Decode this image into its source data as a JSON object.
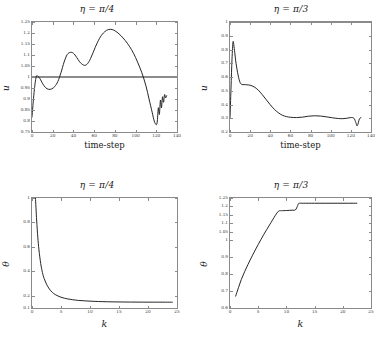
{
  "figure": {
    "panels": [
      {
        "id": "top-left",
        "title_symbol": "η",
        "title_eq": " = ",
        "title_value": "π/4",
        "xlabel": "time-step",
        "ylabel": "u"
      },
      {
        "id": "top-right",
        "title_symbol": "η",
        "title_eq": " = ",
        "title_value": "π/3",
        "xlabel": "time-step",
        "ylabel": "u"
      },
      {
        "id": "bottom-left",
        "title_symbol": "η",
        "title_eq": " = ",
        "title_value": "π/4",
        "xlabel": "k",
        "ylabel": "θ"
      },
      {
        "id": "bottom-right",
        "title_symbol": "η",
        "title_eq": " = ",
        "title_value": "π/3",
        "xlabel": "k",
        "ylabel": "θ"
      }
    ]
  },
  "chart_data": [
    {
      "type": "line",
      "id": "top-left",
      "title": "η = π/4",
      "xlabel": "time-step",
      "ylabel": "u",
      "xlim": [
        0,
        140
      ],
      "ylim": [
        0.75,
        1.25
      ],
      "xticks": [
        0,
        20,
        40,
        60,
        80,
        100,
        120,
        140
      ],
      "yticks": [
        0.75,
        0.8,
        0.85,
        0.9,
        0.95,
        1,
        1.05,
        1.1,
        1.15,
        1.2,
        1.25
      ],
      "grid": false,
      "legend": null,
      "series": [
        {
          "name": "u(t)",
          "color": "#1a1a1a",
          "x": [
            0,
            2,
            4,
            6,
            8,
            10,
            13,
            16,
            19,
            22,
            25,
            28,
            31,
            34,
            37,
            40,
            43,
            46,
            49,
            52,
            55,
            58,
            62,
            66,
            70,
            74,
            78,
            82,
            86,
            90,
            94,
            98,
            102,
            106,
            110,
            113,
            116,
            118,
            120,
            121,
            122,
            123,
            124,
            125,
            126,
            127,
            128,
            129,
            130
          ],
          "y": [
            0.818,
            0.93,
            1.0,
            1.002,
            0.99,
            0.972,
            0.952,
            0.944,
            0.946,
            0.957,
            0.98,
            1.02,
            1.068,
            1.102,
            1.112,
            1.108,
            1.09,
            1.069,
            1.056,
            1.054,
            1.07,
            1.1,
            1.145,
            1.182,
            1.205,
            1.216,
            1.215,
            1.204,
            1.187,
            1.166,
            1.14,
            1.108,
            1.067,
            1.02,
            0.96,
            0.9,
            0.84,
            0.8,
            0.783,
            0.8,
            0.86,
            0.83,
            0.895,
            0.86,
            0.91,
            0.885,
            0.92,
            0.905,
            0.915
          ]
        },
        {
          "name": "reference u = 1",
          "color": "#1a1a1a",
          "x": [
            0,
            140
          ],
          "y": [
            1.0,
            1.0
          ]
        }
      ]
    },
    {
      "type": "line",
      "id": "top-right",
      "title": "η = π/3",
      "xlabel": "time-step",
      "ylabel": "u",
      "xlim": [
        0,
        140
      ],
      "ylim": [
        0.2,
        1.0
      ],
      "xticks": [
        0,
        20,
        40,
        60,
        80,
        100,
        120,
        140
      ],
      "yticks": [
        0.2,
        0.3,
        0.4,
        0.5,
        0.6,
        0.7,
        0.8,
        0.9,
        1.0
      ],
      "grid": false,
      "legend": null,
      "series": [
        {
          "name": "reference u = 1",
          "color": "#1a1a1a",
          "x": [
            0,
            138
          ],
          "y": [
            1.0,
            1.0
          ]
        },
        {
          "name": "u(t)",
          "color": "#1a1a1a",
          "x": [
            0,
            1,
            2,
            3,
            4,
            5,
            6,
            8,
            10,
            12,
            14,
            17,
            20,
            24,
            28,
            32,
            36,
            40,
            44,
            48,
            52,
            56,
            60,
            66,
            72,
            78,
            84,
            90,
            96,
            102,
            108,
            112,
            116,
            120,
            123,
            125,
            126,
            127,
            128,
            129,
            130
          ],
          "y": [
            0.3,
            0.52,
            0.73,
            0.855,
            0.82,
            0.76,
            0.7,
            0.615,
            0.56,
            0.545,
            0.545,
            0.543,
            0.54,
            0.528,
            0.505,
            0.472,
            0.435,
            0.398,
            0.365,
            0.34,
            0.322,
            0.312,
            0.307,
            0.305,
            0.308,
            0.315,
            0.318,
            0.316,
            0.31,
            0.303,
            0.298,
            0.297,
            0.3,
            0.305,
            0.3,
            0.268,
            0.245,
            0.255,
            0.285,
            0.3,
            0.305
          ]
        }
      ]
    },
    {
      "type": "line",
      "id": "bottom-left",
      "title": "η = π/4",
      "xlabel": "k",
      "ylabel": "θ",
      "xlim": [
        0,
        25
      ],
      "ylim": [
        0.1,
        1.0
      ],
      "xticks": [
        0,
        5,
        10,
        15,
        20,
        25
      ],
      "yticks": [
        0.1,
        0.2,
        0.4,
        0.6,
        0.8,
        1.0
      ],
      "grid": false,
      "legend": null,
      "series": [
        {
          "name": "θ(k)",
          "color": "#1a1a1a",
          "x": [
            0.6,
            0.8,
            1.0,
            1.2,
            1.5,
            1.8,
            2.1,
            2.5,
            3.0,
            3.5,
            4.0,
            4.5,
            5.0,
            5.6,
            6.2,
            7.0,
            8.0,
            9.0,
            10.0,
            11.5,
            13.0,
            15.0,
            17.0,
            19.0,
            21.0,
            23.0,
            24.2
          ],
          "y": [
            1.0,
            0.82,
            0.68,
            0.575,
            0.465,
            0.39,
            0.34,
            0.295,
            0.255,
            0.228,
            0.21,
            0.198,
            0.188,
            0.18,
            0.174,
            0.168,
            0.162,
            0.159,
            0.156,
            0.153,
            0.151,
            0.1495,
            0.1485,
            0.148,
            0.1478,
            0.1476,
            0.1475
          ]
        }
      ]
    },
    {
      "type": "line",
      "id": "bottom-right",
      "title": "η = π/3",
      "xlabel": "k",
      "ylabel": "θ",
      "xlim": [
        0,
        25
      ],
      "ylim": [
        0.6,
        1.25
      ],
      "xticks": [
        0,
        5,
        10,
        15,
        20,
        25
      ],
      "yticks": [
        0.6,
        0.7,
        0.8,
        0.9,
        1.0,
        1.05,
        1.1,
        1.15,
        1.2,
        1.25
      ],
      "grid": false,
      "legend": null,
      "series": [
        {
          "name": "θ(k)",
          "color": "#1a1a1a",
          "x": [
            1.0,
            1.5,
            2.0,
            2.6,
            3.2,
            4.0,
            5.0,
            6.0,
            7.0,
            8.0,
            8.6,
            9.0,
            9.2,
            10.0,
            11.0,
            11.6,
            12.0,
            12.2,
            13.0,
            15.0,
            17.0,
            19.0,
            21.0,
            22.5
          ],
          "y": [
            0.67,
            0.72,
            0.768,
            0.815,
            0.858,
            0.912,
            0.975,
            1.035,
            1.09,
            1.145,
            1.172,
            1.175,
            1.175,
            1.176,
            1.178,
            1.18,
            1.205,
            1.218,
            1.219,
            1.219,
            1.219,
            1.219,
            1.219,
            1.219
          ]
        }
      ]
    }
  ]
}
